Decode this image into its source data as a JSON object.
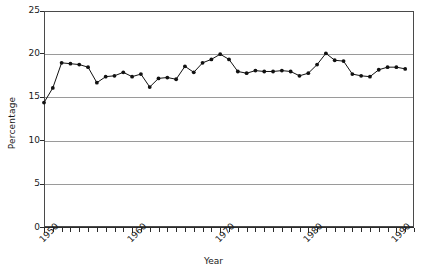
{
  "chart_data": {
    "type": "line",
    "title": "",
    "xlabel": "Year",
    "ylabel": "Percentage",
    "xlim": [
      1950,
      1992
    ],
    "ylim": [
      0,
      25
    ],
    "yticks": [
      0,
      5,
      10,
      15,
      20,
      25
    ],
    "xticks": [
      1950,
      1960,
      1970,
      1980,
      1990
    ],
    "xtick_labels": [
      "1950",
      "1960",
      "1970",
      "1980",
      "1990"
    ],
    "ytick_labels": [
      "0",
      "5",
      "10",
      "15",
      "20",
      "25"
    ],
    "grid": "horizontal",
    "legend": "none",
    "marker": "filled-circle",
    "x": [
      1950,
      1951,
      1952,
      1953,
      1954,
      1955,
      1956,
      1957,
      1958,
      1959,
      1960,
      1961,
      1962,
      1963,
      1964,
      1965,
      1966,
      1967,
      1968,
      1969,
      1970,
      1971,
      1972,
      1973,
      1974,
      1975,
      1976,
      1977,
      1978,
      1979,
      1980,
      1981,
      1982,
      1983,
      1984,
      1985,
      1986,
      1987,
      1988,
      1989,
      1990,
      1991
    ],
    "values": [
      14.4,
      16.1,
      19.0,
      18.9,
      18.8,
      18.5,
      16.7,
      17.4,
      17.5,
      17.9,
      17.4,
      17.7,
      16.2,
      17.2,
      17.3,
      17.1,
      18.6,
      17.9,
      19.0,
      19.4,
      20.0,
      19.4,
      18.0,
      17.8,
      18.1,
      18.0,
      18.0,
      18.1,
      18.0,
      17.5,
      17.8,
      18.8,
      20.1,
      19.3,
      19.2,
      17.7,
      17.5,
      17.4,
      18.2,
      18.5,
      18.5,
      18.3
    ],
    "series_name": "Percentage"
  }
}
